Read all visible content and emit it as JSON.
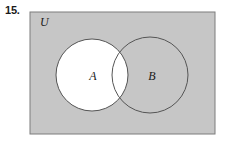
{
  "figure": {
    "exercise_number": "15.",
    "type": "venn-diagram",
    "universal_set": {
      "label": "U",
      "label_x": 40,
      "label_y": 26,
      "fill_color": "#c6c6c6",
      "stroke_color": "#7d7d7d",
      "rect": {
        "x": 30,
        "y": 12,
        "width": 185,
        "height": 122
      }
    },
    "sets": [
      {
        "label": "A",
        "label_x": 93,
        "label_y": 80,
        "cx": 92,
        "cy": 75,
        "r": 36,
        "fill_color": "#ffffff",
        "stroke_color": "#555555",
        "shaded": true
      },
      {
        "label": "B",
        "label_x": 152,
        "label_y": 80,
        "cx": 150,
        "cy": 75,
        "r": 38,
        "fill_color": "#c6c6c6",
        "stroke_color": "#555555",
        "shaded": false
      }
    ],
    "page_background": "#ffffff"
  }
}
